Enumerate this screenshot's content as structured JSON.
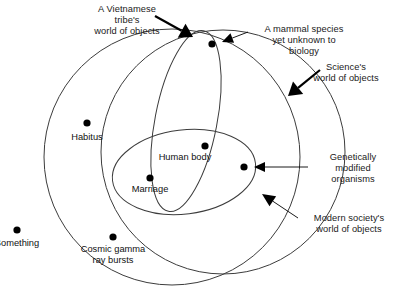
{
  "figure": {
    "kind": "venn-diagram",
    "background": "#ffffff",
    "stroke_color": "#3c3c3c",
    "dot_color": "#000000",
    "text_color": "#1a1a1a"
  },
  "sets": [
    {
      "id": "modern-society",
      "label": "Modern society's\nworld of objects",
      "shape": "circle",
      "cx": 172,
      "cy": 157,
      "rx": 128,
      "ry": 128,
      "rotate": 0
    },
    {
      "id": "science",
      "label": "Science's\nworld of objects",
      "shape": "circle",
      "cx": 223,
      "cy": 152,
      "rx": 122,
      "ry": 122,
      "rotate": 0
    },
    {
      "id": "vietnamese-tribe",
      "label": "A Vietnamese\ntribe's\nworld of objects",
      "shape": "ellipse",
      "cx": 186,
      "cy": 121,
      "rx": 31,
      "ry": 92,
      "rotate": 11
    },
    {
      "id": "human-body-region",
      "label": "",
      "shape": "ellipse",
      "cx": 184,
      "cy": 172,
      "rx": 72,
      "ry": 42,
      "rotate": -7
    }
  ],
  "nodes": [
    {
      "id": "mammal-species",
      "label": "",
      "cx": 212,
      "cy": 44
    },
    {
      "id": "habitus",
      "label": "Habitus",
      "cx": 87,
      "cy": 123
    },
    {
      "id": "human-body",
      "label": "Human body",
      "cx": 205,
      "cy": 146
    },
    {
      "id": "gmo",
      "label": "",
      "cx": 244,
      "cy": 167
    },
    {
      "id": "marriage",
      "label": "Marriage",
      "cx": 150,
      "cy": 178
    },
    {
      "id": "cosmic-gamma",
      "label": "Cosmic gamma\nray bursts",
      "cx": 113,
      "cy": 237
    },
    {
      "id": "something",
      "label": "Something",
      "cx": 17,
      "cy": 230
    }
  ],
  "node_labels": [
    {
      "id": "habitus-label",
      "text": "Habitus",
      "x": 87,
      "y": 132
    },
    {
      "id": "human-body-label",
      "text": "Human body",
      "x": 185,
      "y": 152
    },
    {
      "id": "marriage-label",
      "text": "Marriage",
      "x": 150,
      "y": 184
    },
    {
      "id": "cosmic-gamma-label",
      "text": "Cosmic gamma\nray bursts",
      "x": 113,
      "y": 244
    },
    {
      "id": "something-label",
      "text": "Something",
      "x": 17,
      "y": 238
    }
  ],
  "callouts": [
    {
      "id": "vietnamese-tribe-callout",
      "text": "A Vietnamese\ntribe's\nworld of objects",
      "align": "center",
      "x": 72,
      "y": 4,
      "w": 110,
      "arrow": {
        "type": "solid-arrow",
        "x1": 155,
        "y1": 16,
        "x2": 193,
        "y2": 37,
        "head": 13
      }
    },
    {
      "id": "mammal-species-callout",
      "text": "A mammal species\nyet unknown to\nbiology",
      "align": "center",
      "x": 250,
      "y": 24,
      "w": 108,
      "arrow": {
        "type": "thin-arrow",
        "x1": 248,
        "y1": 32,
        "x2": 222,
        "y2": 42,
        "head": 11
      }
    },
    {
      "id": "science-callout",
      "text": "Science's\nworld of objects",
      "align": "center",
      "x": 293,
      "y": 62,
      "w": 106,
      "arrow": {
        "type": "solid-arrow",
        "x1": 320,
        "y1": 70,
        "x2": 288,
        "y2": 96,
        "head": 13
      }
    },
    {
      "id": "gmo-callout",
      "text": "Genetically\nmodified\norganisms",
      "align": "center",
      "x": 309,
      "y": 152,
      "w": 88,
      "arrow": {
        "type": "thin-arrow",
        "x1": 308,
        "y1": 167,
        "x2": 254,
        "y2": 167,
        "head": 11
      }
    },
    {
      "id": "modern-society-callout",
      "text": "Modern society's\nworld of objects",
      "align": "center",
      "x": 296,
      "y": 213,
      "w": 106,
      "arrow": {
        "type": "thin-arrow",
        "x1": 298,
        "y1": 218,
        "x2": 262,
        "y2": 194,
        "head": 13
      }
    }
  ]
}
